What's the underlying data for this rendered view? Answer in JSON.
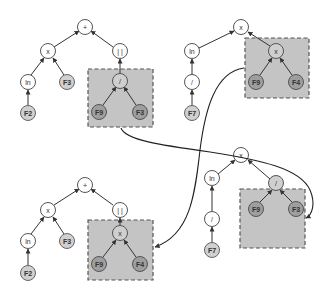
{
  "diagram": {
    "parents": {
      "left": {
        "root": "+",
        "children": [
          "x",
          "||"
        ],
        "x_children": [
          "ln",
          "F3"
        ],
        "ln_child": "F2",
        "selected_subtree": {
          "op": "/",
          "children": [
            "F9",
            "F3"
          ]
        }
      },
      "right": {
        "root": "x",
        "children": [
          "ln",
          "x"
        ],
        "ln_child": "/",
        "div_child": "F7",
        "selected_subtree": {
          "op": "x",
          "children": [
            "F9",
            "F4"
          ]
        }
      }
    },
    "offspring": {
      "left": {
        "root": "+",
        "children": [
          "x",
          "||"
        ],
        "x_children": [
          "ln",
          "F3"
        ],
        "ln_child": "F2",
        "inserted_subtree": {
          "op": "x",
          "children": [
            "F9",
            "F4"
          ]
        }
      },
      "right": {
        "root": "x",
        "children": [
          "ln",
          "/"
        ],
        "ln_child": "/",
        "div_child": "F7",
        "inserted_subtree": {
          "op": "/",
          "children": [
            "F9",
            "F3"
          ]
        }
      }
    },
    "labels": {
      "plus": "+",
      "times": "x",
      "abs": "| |",
      "div": "/",
      "ln": "ln",
      "F2": "F2",
      "F3": "F3",
      "F4": "F4",
      "F7": "F7",
      "F9": "F9"
    },
    "colors": {
      "box_fill": "#c4c4c4",
      "leaf_light": "#d0d0d0",
      "leaf_dark": "#9e9e9e",
      "edge": "#333333"
    }
  }
}
